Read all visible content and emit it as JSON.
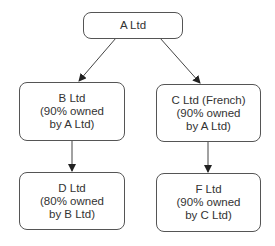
{
  "diagram": {
    "type": "organization-chart",
    "nodes": [
      {
        "id": "A",
        "lines": [
          "A Ltd"
        ]
      },
      {
        "id": "B",
        "lines": [
          "B Ltd",
          "(90% owned",
          "by A Ltd)"
        ]
      },
      {
        "id": "C",
        "lines": [
          "C Ltd (French)",
          "(90% owned",
          "by A Ltd)"
        ]
      },
      {
        "id": "D",
        "lines": [
          "D Ltd",
          "(80% owned",
          "by B Ltd)"
        ]
      },
      {
        "id": "F",
        "lines": [
          "F Ltd",
          "(90% owned",
          "by C Ltd)"
        ]
      }
    ],
    "edges": [
      {
        "from": "A",
        "to": "B"
      },
      {
        "from": "A",
        "to": "C"
      },
      {
        "from": "B",
        "to": "D"
      },
      {
        "from": "C",
        "to": "F"
      }
    ],
    "colors": {
      "stroke": "#555555",
      "text": "#333333",
      "background": "#ffffff"
    }
  }
}
